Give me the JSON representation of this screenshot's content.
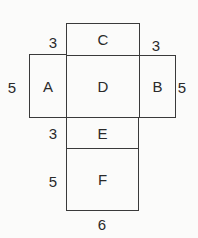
{
  "diagram": {
    "type": "net of a rectangular prism",
    "faces": [
      {
        "id": "C",
        "label": "C"
      },
      {
        "id": "A",
        "label": "A"
      },
      {
        "id": "D",
        "label": "D"
      },
      {
        "id": "B",
        "label": "B"
      },
      {
        "id": "E",
        "label": "E"
      },
      {
        "id": "F",
        "label": "F"
      }
    ],
    "dimensions": {
      "c_height": "3",
      "b_top": "3",
      "a_height": "5",
      "b_height": "5",
      "e_height": "3",
      "f_height": "5",
      "f_width": "6"
    }
  }
}
